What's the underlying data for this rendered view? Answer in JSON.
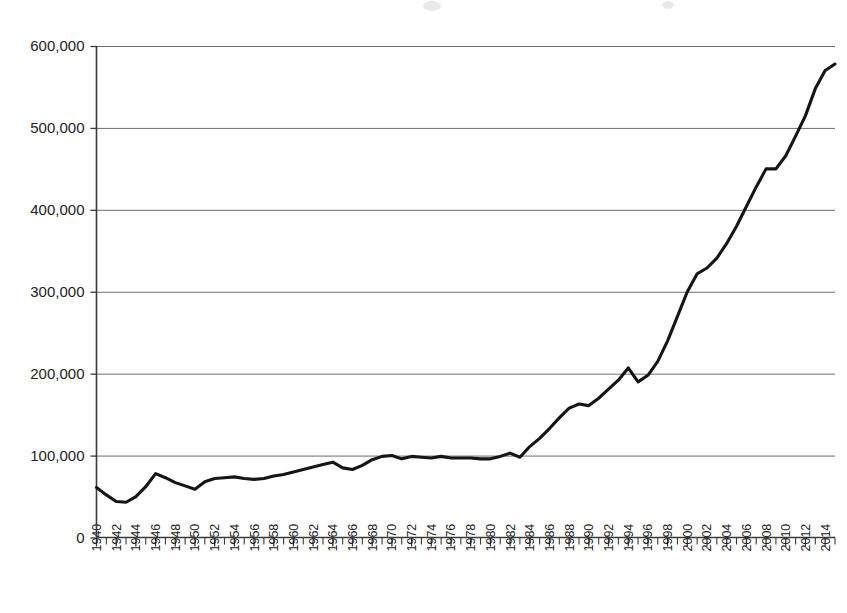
{
  "chart_data": {
    "type": "line",
    "title": "",
    "subtitle": "",
    "xlabel": "",
    "ylabel": "",
    "xlim": [
      1940,
      2015
    ],
    "ylim": [
      0,
      600000
    ],
    "grid": "horizontal",
    "legend": "none",
    "y_ticks": [
      0,
      100000,
      200000,
      300000,
      400000,
      500000,
      600000
    ],
    "y_tick_labels": [
      "0",
      "100,000",
      "200,000",
      "300,000",
      "400,000",
      "500,000",
      "600,000"
    ],
    "x_tick_labels": [
      "1940",
      "1942",
      "1944",
      "1946",
      "1948",
      "1950",
      "1952",
      "1954",
      "1956",
      "1958",
      "1960",
      "1962",
      "1964",
      "1966",
      "1968",
      "1970",
      "1972",
      "1974",
      "1976",
      "1978",
      "1980",
      "1982",
      "1984",
      "1986",
      "1988",
      "1990",
      "1992",
      "1994",
      "1996",
      "1998",
      "2000",
      "2002",
      "2004",
      "2006",
      "2008",
      "2010",
      "2012",
      "2014"
    ],
    "x_minor_tick_interval": 1,
    "x_major_tick_interval": 2,
    "series": [
      {
        "name": "series-1",
        "color": "#151515",
        "line_width": 3.1,
        "marker": "none",
        "x": [
          1940,
          1941,
          1942,
          1943,
          1944,
          1945,
          1946,
          1947,
          1948,
          1949,
          1950,
          1951,
          1952,
          1953,
          1954,
          1955,
          1956,
          1957,
          1958,
          1959,
          1960,
          1961,
          1962,
          1963,
          1964,
          1965,
          1966,
          1967,
          1968,
          1969,
          1970,
          1971,
          1972,
          1973,
          1974,
          1975,
          1976,
          1977,
          1978,
          1979,
          1980,
          1981,
          1982,
          1983,
          1984,
          1985,
          1986,
          1987,
          1988,
          1989,
          1990,
          1991,
          1992,
          1993,
          1994,
          1995,
          1996,
          1997,
          1998,
          1999,
          2000,
          2001,
          2002,
          2003,
          2004,
          2005,
          2006,
          2007,
          2008,
          2009,
          2010,
          2011,
          2012,
          2013,
          2014,
          2015
        ],
        "values": [
          61000,
          52000,
          44000,
          43000,
          50000,
          62000,
          78000,
          73000,
          67000,
          63000,
          59000,
          68000,
          72000,
          73000,
          74000,
          72000,
          71000,
          72000,
          75000,
          77000,
          80000,
          83000,
          86000,
          89000,
          92000,
          85000,
          83000,
          88000,
          95000,
          99000,
          100000,
          96000,
          99000,
          98000,
          97000,
          99000,
          97000,
          97000,
          97000,
          96000,
          96000,
          99000,
          103000,
          98000,
          111000,
          121000,
          133000,
          146000,
          158000,
          163000,
          161000,
          170000,
          181000,
          192000,
          207000,
          190000,
          198000,
          215000,
          240000,
          270000,
          300000,
          322000,
          329000,
          341000,
          359000,
          380000,
          404000,
          428000,
          450000,
          450000,
          466000,
          490000,
          515000,
          548000,
          570000,
          578000
        ]
      }
    ]
  },
  "axis": {
    "y_axis_name": "y-axis",
    "x_axis_name": "x-axis"
  }
}
